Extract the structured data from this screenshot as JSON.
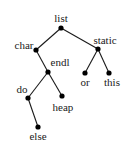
{
  "diagram": {
    "type": "tree",
    "nodes": [
      {
        "id": "list",
        "label": "list",
        "x": 61,
        "y": 28,
        "lx": 61,
        "ly": 22,
        "anchor": "middle"
      },
      {
        "id": "char",
        "label": "char",
        "x": 36,
        "y": 50,
        "lx": 24,
        "ly": 49,
        "anchor": "middle"
      },
      {
        "id": "static",
        "label": "static",
        "x": 98,
        "y": 49,
        "lx": 105,
        "ly": 44,
        "anchor": "middle"
      },
      {
        "id": "endl",
        "label": "endl",
        "x": 48,
        "y": 72,
        "lx": 60,
        "ly": 66,
        "anchor": "middle"
      },
      {
        "id": "or",
        "label": "or",
        "x": 85,
        "y": 73,
        "lx": 85,
        "ly": 86,
        "anchor": "middle"
      },
      {
        "id": "this",
        "label": "this",
        "x": 109,
        "y": 73,
        "lx": 112,
        "ly": 86,
        "anchor": "middle"
      },
      {
        "id": "do",
        "label": "do",
        "x": 28,
        "y": 98,
        "lx": 22,
        "ly": 93,
        "anchor": "middle"
      },
      {
        "id": "heap",
        "label": "heap",
        "x": 62,
        "y": 96,
        "lx": 63,
        "ly": 111,
        "anchor": "middle"
      },
      {
        "id": "else",
        "label": "else",
        "x": 38,
        "y": 127,
        "lx": 38,
        "ly": 140,
        "anchor": "middle"
      }
    ],
    "edges": [
      [
        "list",
        "char"
      ],
      [
        "list",
        "static"
      ],
      [
        "char",
        "endl"
      ],
      [
        "static",
        "or"
      ],
      [
        "static",
        "this"
      ],
      [
        "endl",
        "do"
      ],
      [
        "endl",
        "heap"
      ],
      [
        "do",
        "else"
      ]
    ]
  }
}
